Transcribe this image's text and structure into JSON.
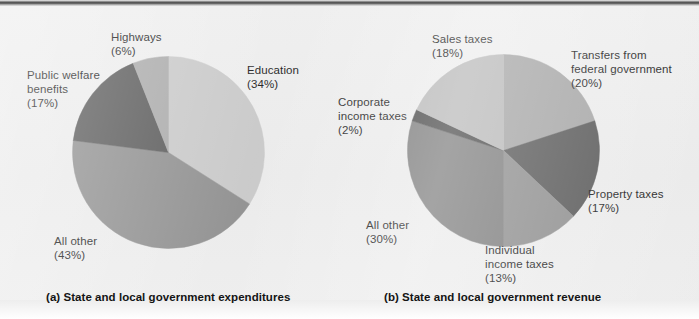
{
  "figure": {
    "width": 699,
    "height": 319,
    "background": "#ececec",
    "rule_color": "#404040"
  },
  "captions": {
    "a": "(a) State and local government expenditures",
    "b": "(b) State and local government revenue"
  },
  "chart_data": [
    {
      "type": "pie",
      "id": "expenditures",
      "title": "(a) State and local government expenditures",
      "center": [
        168,
        152
      ],
      "radius": 96,
      "start_angle_deg": 0,
      "direction": "clockwise",
      "categories": [
        "Education",
        "All other",
        "Public welfare benefits",
        "Highways"
      ],
      "values": [
        34,
        43,
        17,
        6
      ],
      "unit": "percent",
      "colors": [
        "#c8c8c8",
        "#8e8e8e",
        "#585858",
        "#a9a9a9"
      ],
      "labels": [
        {
          "name": "Education",
          "percent": "34%",
          "text": "Education\n(34%)"
        },
        {
          "name": "All other",
          "percent": "43%",
          "text": "All other\n(43%)"
        },
        {
          "name": "Public welfare benefits",
          "percent": "17%",
          "text": "Public welfare\nbenefits\n(17%)"
        },
        {
          "name": "Highways",
          "percent": "6%",
          "text": "Highways\n(6%)"
        }
      ],
      "legend": "none",
      "grid": false
    },
    {
      "type": "pie",
      "id": "revenue",
      "title": "(b) State and local government revenue",
      "center": [
        503,
        150
      ],
      "radius": 96,
      "start_angle_deg": 0,
      "direction": "clockwise",
      "categories": [
        "Transfers from federal government",
        "Property taxes",
        "Individual income taxes",
        "All other",
        "Corporate income taxes",
        "Sales taxes"
      ],
      "values": [
        20,
        17,
        13,
        30,
        2,
        18
      ],
      "unit": "percent",
      "colors": [
        "#a5a5a5",
        "#585858",
        "#8e8e8e",
        "#7d7d7d",
        "#4a4a4a",
        "#b8b8b8"
      ],
      "labels": [
        {
          "name": "Sales taxes",
          "percent": "18%",
          "text": "Sales taxes\n(18%)"
        },
        {
          "name": "Transfers from federal government",
          "percent": "20%",
          "text": "Transfers from\nfederal government\n(20%)"
        },
        {
          "name": "Corporate income taxes",
          "percent": "2%",
          "text": "Corporate\nincome taxes\n(2%)"
        },
        {
          "name": "Property taxes",
          "percent": "17%",
          "text": "Property taxes\n(17%)"
        },
        {
          "name": "All other",
          "percent": "30%",
          "text": "All other\n(30%)"
        },
        {
          "name": "Individual income taxes",
          "percent": "13%",
          "text": "Individual\nincome taxes\n(13%)"
        }
      ],
      "legend": "none",
      "grid": false
    }
  ]
}
